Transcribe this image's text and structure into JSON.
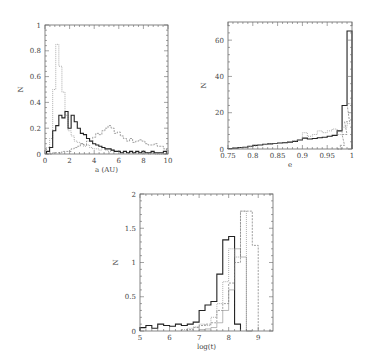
{
  "chart_data": [
    {
      "id": "panel-a",
      "type": "line",
      "subtype": "step-histogram",
      "title": "",
      "xlabel": "a (AU)",
      "ylabel": "N",
      "xlim": [
        0,
        10
      ],
      "ylim": [
        0,
        1
      ],
      "xticks": [
        0,
        2,
        4,
        6,
        8,
        10
      ],
      "yticks": [
        0,
        0.2,
        0.4,
        0.6,
        0.8,
        1
      ],
      "xtick_labels": [
        "0",
        "2",
        "4",
        "6",
        "8",
        "10"
      ],
      "ytick_labels": [
        "0",
        "0.2",
        "0.4",
        "0.6",
        "0.8",
        "1"
      ],
      "grid": false,
      "legend": null,
      "bin_width": 0.25,
      "series": [
        {
          "name": "dotted (light)",
          "style": "dotted",
          "x": [
            0.25,
            0.5,
            0.75,
            1.0,
            1.25,
            1.5,
            1.75,
            2.0,
            2.25,
            2.5,
            2.75,
            3.0,
            3.25,
            3.5,
            3.75,
            4.0,
            4.25,
            4.5,
            4.75,
            5.0,
            5.25,
            5.5,
            5.75,
            6.0,
            6.25,
            6.5,
            6.75,
            7.0,
            7.25,
            7.5,
            7.75,
            8.0,
            8.25,
            8.5,
            8.75,
            9.0,
            9.25,
            9.5,
            9.75
          ],
          "values": [
            0.05,
            0.12,
            0.5,
            0.85,
            0.68,
            0.48,
            0.3,
            0.18,
            0.14,
            0.1,
            0.09,
            0.08,
            0.06,
            0.07,
            0.05,
            0.04,
            0.04,
            0.03,
            0.05,
            0.03,
            0.02,
            0.03,
            0.02,
            0.02,
            0.01,
            0.02,
            0.01,
            0.01,
            0.01,
            0.01,
            0.01,
            0.0,
            0.01,
            0.0,
            0.01,
            0.0,
            0.0,
            0.0,
            0.0
          ]
        },
        {
          "name": "solid (heavy)",
          "style": "solid",
          "x": [
            0.25,
            0.5,
            0.75,
            1.0,
            1.25,
            1.5,
            1.75,
            2.0,
            2.25,
            2.5,
            2.75,
            3.0,
            3.25,
            3.5,
            3.75,
            4.0,
            4.25,
            4.5,
            4.75,
            5.0,
            5.25,
            5.5,
            5.75,
            6.0,
            6.25,
            6.5,
            6.75,
            7.0,
            7.25,
            7.5,
            7.75,
            8.0,
            8.25,
            8.5,
            8.75,
            9.0,
            9.25,
            9.5,
            9.75
          ],
          "values": [
            0.02,
            0.05,
            0.18,
            0.22,
            0.3,
            0.28,
            0.33,
            0.2,
            0.3,
            0.25,
            0.2,
            0.16,
            0.15,
            0.12,
            0.1,
            0.08,
            0.07,
            0.06,
            0.05,
            0.04,
            0.04,
            0.03,
            0.02,
            0.02,
            0.01,
            0.02,
            0.01,
            0.02,
            0.01,
            0.02,
            0.01,
            0.02,
            0.01,
            0.01,
            0.02,
            0.01,
            0.01,
            0.01,
            0.02
          ]
        },
        {
          "name": "dashed (thin)",
          "style": "dashed",
          "x": [
            0.25,
            0.5,
            0.75,
            1.0,
            1.25,
            1.5,
            1.75,
            2.0,
            2.25,
            2.5,
            2.75,
            3.0,
            3.25,
            3.5,
            3.75,
            4.0,
            4.25,
            4.5,
            4.75,
            5.0,
            5.25,
            5.5,
            5.75,
            6.0,
            6.25,
            6.5,
            6.75,
            7.0,
            7.25,
            7.5,
            7.75,
            8.0,
            8.25,
            8.5,
            8.75,
            9.0,
            9.25,
            9.5,
            9.75
          ],
          "values": [
            0.0,
            0.0,
            0.01,
            0.01,
            0.01,
            0.02,
            0.02,
            0.02,
            0.04,
            0.05,
            0.06,
            0.08,
            0.07,
            0.1,
            0.1,
            0.13,
            0.16,
            0.15,
            0.18,
            0.2,
            0.22,
            0.2,
            0.16,
            0.17,
            0.14,
            0.12,
            0.1,
            0.12,
            0.09,
            0.1,
            0.11,
            0.1,
            0.08,
            0.07,
            0.07,
            0.08,
            0.06,
            0.06,
            0.04
          ]
        }
      ]
    },
    {
      "id": "panel-b",
      "type": "line",
      "subtype": "step-histogram",
      "title": "",
      "xlabel": "e",
      "ylabel": "N",
      "xlim": [
        0.75,
        1
      ],
      "ylim": [
        0,
        70
      ],
      "xticks": [
        0.75,
        0.8,
        0.85,
        0.9,
        0.95,
        1
      ],
      "yticks": [
        0,
        20,
        40,
        60
      ],
      "xtick_labels": [
        "0.75",
        "0.8",
        "0.85",
        "0.9",
        "0.95",
        "1"
      ],
      "ytick_labels": [
        "0",
        "20",
        "40",
        "60"
      ],
      "grid": false,
      "legend": null,
      "bin_width": 0.01,
      "series": [
        {
          "name": "solid (heavy)",
          "style": "solid",
          "x": [
            0.755,
            0.765,
            0.775,
            0.785,
            0.795,
            0.805,
            0.815,
            0.825,
            0.835,
            0.845,
            0.855,
            0.865,
            0.875,
            0.885,
            0.895,
            0.905,
            0.915,
            0.925,
            0.935,
            0.945,
            0.955,
            0.965,
            0.975,
            0.985,
            0.995
          ],
          "values": [
            0.3,
            0.5,
            0.8,
            1,
            1.5,
            2,
            2.2,
            2.6,
            2.8,
            3,
            3.3,
            3.5,
            3.8,
            4.2,
            5,
            6,
            5.5,
            5.8,
            6.2,
            6.5,
            7,
            7.5,
            10,
            24,
            65
          ]
        },
        {
          "name": "dotted (light)",
          "style": "dotted",
          "x": [
            0.755,
            0.765,
            0.775,
            0.785,
            0.795,
            0.805,
            0.815,
            0.825,
            0.835,
            0.845,
            0.855,
            0.865,
            0.875,
            0.885,
            0.895,
            0.905,
            0.915,
            0.925,
            0.935,
            0.945,
            0.955,
            0.965,
            0.975,
            0.985,
            0.995
          ],
          "values": [
            0.2,
            0.3,
            0.6,
            0.9,
            1.2,
            1.6,
            2,
            2.4,
            2.7,
            3,
            3.2,
            3.6,
            4,
            4.5,
            5,
            9,
            7,
            8,
            10,
            9,
            10,
            11,
            8,
            12,
            14
          ]
        },
        {
          "name": "dashed (thin)",
          "style": "dashed",
          "x": [
            0.975,
            0.98,
            0.985,
            0.99,
            0.995
          ],
          "values": [
            0,
            2,
            8,
            15,
            25
          ]
        }
      ]
    },
    {
      "id": "panel-c",
      "type": "line",
      "subtype": "step-histogram",
      "title": "",
      "xlabel": "log(t)",
      "ylabel": "N",
      "xlim": [
        5,
        9.5
      ],
      "ylim": [
        0,
        2
      ],
      "xticks": [
        5,
        6,
        7,
        8,
        9
      ],
      "yticks": [
        0,
        0.5,
        1,
        1.5,
        2
      ],
      "xtick_labels": [
        "5",
        "6",
        "7",
        "8",
        "9"
      ],
      "ytick_labels": [
        "0",
        "0.5",
        "1",
        "1.5",
        "2"
      ],
      "grid": false,
      "legend": null,
      "bin_width": 0.2,
      "series": [
        {
          "name": "solid (heavy)",
          "style": "solid",
          "x": [
            5.0,
            5.2,
            5.4,
            5.6,
            5.8,
            6.0,
            6.2,
            6.4,
            6.6,
            6.8,
            7.0,
            7.2,
            7.4,
            7.6,
            7.8,
            8.0,
            8.2
          ],
          "values": [
            0.05,
            0.08,
            0.04,
            0.1,
            0.08,
            0.07,
            0.1,
            0.08,
            0.1,
            0.13,
            0.3,
            0.38,
            0.43,
            0.83,
            1.33,
            1.38,
            0.1
          ]
        },
        {
          "name": "dotted (light)",
          "style": "dotted",
          "x": [
            6.4,
            6.6,
            6.8,
            7.0,
            7.2,
            7.4,
            7.6,
            7.8,
            8.0,
            8.2,
            8.4,
            8.6
          ],
          "values": [
            0.02,
            0.04,
            0.06,
            0.1,
            0.08,
            0.2,
            0.4,
            0.72,
            1.2,
            1.08,
            1.75,
            0.0
          ]
        },
        {
          "name": "thin solid",
          "style": "thin",
          "x": [
            7.0,
            7.2,
            7.4,
            7.6,
            7.8,
            8.0,
            8.2,
            8.4,
            8.6
          ],
          "values": [
            0.02,
            0.03,
            0.05,
            0.12,
            0.3,
            0.6,
            1.2,
            1.08,
            0.0
          ]
        },
        {
          "name": "dashed",
          "style": "dashed",
          "x": [
            6.6,
            6.8,
            7.0,
            7.2,
            7.4,
            7.6,
            7.8,
            8.0,
            8.2,
            8.4,
            8.6,
            8.8
          ],
          "values": [
            0.02,
            0.05,
            0.08,
            0.1,
            0.12,
            0.3,
            0.4,
            0.7,
            1.0,
            1.75,
            1.75,
            1.25
          ]
        }
      ]
    }
  ],
  "panels": {
    "a": {
      "xlabel": "a (AU)",
      "ylabel": "N"
    },
    "b": {
      "xlabel": "e",
      "ylabel": "N"
    },
    "c": {
      "xlabel": "log(t)",
      "ylabel": "N"
    }
  }
}
